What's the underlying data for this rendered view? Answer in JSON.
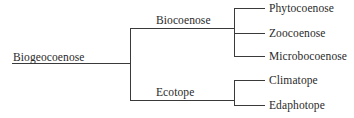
{
  "diagram": {
    "root": {
      "label": "Biogeocoenose"
    },
    "branches": [
      {
        "label": "Biocoenose",
        "children": [
          {
            "label": "Phytocoenose"
          },
          {
            "label": "Zoocoenose"
          },
          {
            "label": "Microbocoenose"
          }
        ]
      },
      {
        "label": "Ecotope",
        "children": [
          {
            "label": "Climatope"
          },
          {
            "label": "Edaphotope"
          }
        ]
      }
    ]
  }
}
